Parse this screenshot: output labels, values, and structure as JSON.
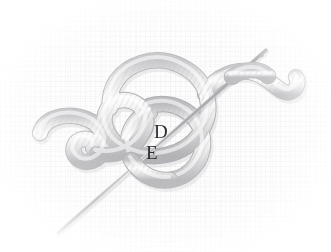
{
  "figure": {
    "background_color": "#fdfdfd",
    "texture": "woven-canvas-grid",
    "cord": {
      "name": "twisted-cord",
      "fill_light": "#f2f2f2",
      "fill_mid": "#d9d9da",
      "fill_dark": "#b3b3b6",
      "outline": "#a9a9ad",
      "rib_color": "#bcbcc0",
      "width_px": 15
    },
    "needle": {
      "name": "sewing-needle",
      "color": "#8d8d92",
      "highlight": "#e7e7e9",
      "tip": [
        58,
        233
      ],
      "eye_end": [
        266,
        50
      ],
      "length_px": 258
    }
  },
  "labels": [
    {
      "id": "label-d",
      "text": "D",
      "x": 154,
      "y": 122,
      "color": "#2e2e2e"
    },
    {
      "id": "label-e",
      "text": "E",
      "x": 146,
      "y": 143,
      "color": "#2e2e2e"
    }
  ]
}
